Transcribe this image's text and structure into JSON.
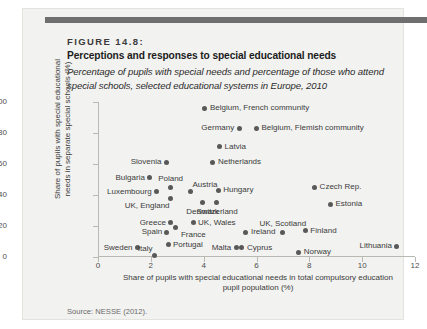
{
  "figure": {
    "number": "FIGURE 14.8:",
    "title": "Perceptions and responses to special educational needs",
    "subtitle": "Percentage of pupils with special needs and percentage of those who attend special schools, selected educational systems in Europe, 2010",
    "source": "Source: NESSE (2012)."
  },
  "colors": {
    "top_rule": "#6f6f6f",
    "card_background": "#f2f2f0",
    "marker": "#595959",
    "axis": "#b9b9b4",
    "text": "#3b3b3b"
  },
  "chart_data": {
    "type": "scatter",
    "title": "Perceptions and responses to special educational needs",
    "subtitle": "Percentage of pupils with special needs and percentage of those who attend special schools, selected educational systems in Europe, 2010",
    "xlabel": "Share of pupils with special educational needs in total compulsory education pupil population (%)",
    "ylabel": "Share of pupils with special educational needs in separate special schools (%)",
    "xlim": [
      0,
      12
    ],
    "ylim": [
      0,
      100
    ],
    "xticks": [
      0,
      2,
      4,
      6,
      8,
      10,
      12
    ],
    "yticks": [
      0,
      20,
      40,
      60,
      80,
      100
    ],
    "grid": false,
    "legend": "none",
    "points": [
      {
        "name": "Belgium, French community",
        "x": 4.05,
        "y": 96,
        "label_side": "right"
      },
      {
        "name": "Germany",
        "x": 5.35,
        "y": 83,
        "label_side": "left"
      },
      {
        "name": "Belgium, Flemish community",
        "x": 6.0,
        "y": 83,
        "label_side": "right"
      },
      {
        "name": "Latvia",
        "x": 4.6,
        "y": 71,
        "label_side": "right"
      },
      {
        "name": "Netherlands",
        "x": 4.35,
        "y": 61,
        "label_side": "right"
      },
      {
        "name": "Slovenia",
        "x": 2.6,
        "y": 61,
        "label_side": "left"
      },
      {
        "name": "Bulgaria",
        "x": 1.95,
        "y": 51,
        "label_side": "left"
      },
      {
        "name": "Luxembourg",
        "x": 2.2,
        "y": 42,
        "label_side": "left"
      },
      {
        "name": "Poland",
        "x": 2.75,
        "y": 45,
        "label_side": "above"
      },
      {
        "name": "UK, England",
        "x": 2.75,
        "y": 38,
        "label_side": "below-left"
      },
      {
        "name": "Austria",
        "x": 3.5,
        "y": 42,
        "label_side": "above-right"
      },
      {
        "name": "Hungary",
        "x": 4.55,
        "y": 43,
        "label_side": "right"
      },
      {
        "name": "Denmark",
        "x": 3.95,
        "y": 35,
        "label_side": "below"
      },
      {
        "name": "Switzerland",
        "x": 4.5,
        "y": 35,
        "label_side": "below"
      },
      {
        "name": "Czech Rep.",
        "x": 8.2,
        "y": 45,
        "label_side": "right"
      },
      {
        "name": "Estonia",
        "x": 8.8,
        "y": 34,
        "label_side": "right"
      },
      {
        "name": "Greece",
        "x": 2.75,
        "y": 22,
        "label_side": "left"
      },
      {
        "name": "France",
        "x": 2.95,
        "y": 19,
        "label_side": "below-right"
      },
      {
        "name": "UK, Wales",
        "x": 3.6,
        "y": 22,
        "label_side": "right"
      },
      {
        "name": "Spain",
        "x": 2.6,
        "y": 16,
        "label_side": "left"
      },
      {
        "name": "Ireland",
        "x": 5.6,
        "y": 16,
        "label_side": "right"
      },
      {
        "name": "UK, Scotland",
        "x": 7.0,
        "y": 16,
        "label_side": "above"
      },
      {
        "name": "Finland",
        "x": 7.85,
        "y": 17,
        "label_side": "right"
      },
      {
        "name": "Lithuania",
        "x": 11.3,
        "y": 7,
        "label_side": "left"
      },
      {
        "name": "Sweden",
        "x": 1.5,
        "y": 6,
        "label_side": "left"
      },
      {
        "name": "Italy",
        "x": 2.15,
        "y": 1,
        "label_side": "above-left"
      },
      {
        "name": "Portugal",
        "x": 2.65,
        "y": 8,
        "label_side": "right"
      },
      {
        "name": "Malta",
        "x": 5.25,
        "y": 6,
        "label_side": "left"
      },
      {
        "name": "Cyprus",
        "x": 5.45,
        "y": 6,
        "label_side": "right"
      },
      {
        "name": "Norway",
        "x": 7.6,
        "y": 3,
        "label_side": "right"
      }
    ]
  }
}
